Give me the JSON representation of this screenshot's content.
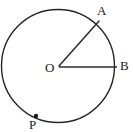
{
  "figure": {
    "type": "circle-with-radii-geometry-diagram",
    "background_color": "#ffffff",
    "stroke_color": "#262626",
    "label_color": "#1a1a1a",
    "labels": {
      "center": "O",
      "point_a": "A",
      "point_b": "B",
      "point_p": "P"
    },
    "icon_names": {
      "circle": "circle-outline-icon",
      "radius_oa": "radius-line-oa-icon",
      "radius_ob": "radius-line-ob-icon",
      "point_p_marker": "point-marker-dot-icon"
    },
    "geometry": {
      "circle": {
        "cx": 58,
        "cy": 66,
        "r": 57,
        "stroke_width": 1.4
      },
      "radius_oa": {
        "x1": 59,
        "y1": 66,
        "x2": 98,
        "y2": 22,
        "stroke_width": 1.4
      },
      "radius_ob": {
        "x1": 59,
        "y1": 67,
        "x2": 116,
        "y2": 67,
        "stroke_width": 1.6
      },
      "point_p": {
        "cx": 36,
        "cy": 116,
        "r": 2.1
      }
    }
  }
}
